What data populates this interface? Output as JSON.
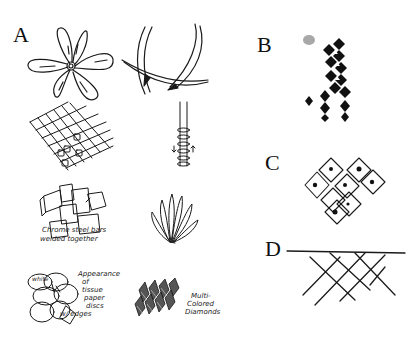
{
  "figure": {
    "panels": [
      {
        "label": "A",
        "sketches": [
          {
            "id": "flower",
            "caption": ""
          },
          {
            "id": "thorn-stems",
            "caption": ""
          },
          {
            "id": "grid-mesh",
            "caption": ""
          },
          {
            "id": "wrapped-rod",
            "caption": ""
          },
          {
            "id": "welded-boxes",
            "caption_line1": "Chrome steel bars",
            "caption_line2": "welded together"
          },
          {
            "id": "fan-leaves",
            "caption": ""
          },
          {
            "id": "paper-discs",
            "caption_lines": [
              "Appearance",
              "of",
              "tissue",
              "paper",
              "discs",
              "w/ edges"
            ],
            "inner_label": "white"
          },
          {
            "id": "diamonds",
            "caption_lines": [
              "Multi-",
              "Colored",
              "Diamonds"
            ]
          }
        ]
      },
      {
        "label": "B",
        "description": "black diamond tile pattern"
      },
      {
        "label": "C",
        "description": "cluster of outlined diamond cells"
      },
      {
        "label": "D",
        "description": "horizontal line with crosshatched net below"
      }
    ]
  }
}
